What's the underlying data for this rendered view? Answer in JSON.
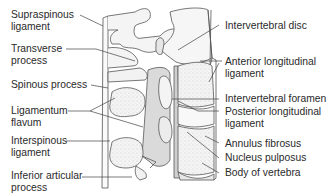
{
  "diagram": {
    "type": "anatomical-illustration",
    "colors": {
      "text": "#2a2a2a",
      "line": "#555555",
      "bone_fill": "#f4f4f4",
      "ligament_fill": "#d9d9d9",
      "stipple": "#aaaaaa"
    },
    "labels_left": [
      {
        "id": "supraspinous-ligament",
        "text": "Supraspinous\nligament"
      },
      {
        "id": "transverse-process",
        "text": "Transverse\nprocess"
      },
      {
        "id": "spinous-process",
        "text": "Spinous process"
      },
      {
        "id": "ligamentum-flavum",
        "text": "Ligamentum\nflavum"
      },
      {
        "id": "interspinous-ligament",
        "text": "Interspinous\nligament"
      },
      {
        "id": "inferior-articular-process",
        "text": "Inferior articular\nprocess"
      }
    ],
    "labels_right": [
      {
        "id": "intervertebral-disc",
        "text": "Intervertebral disc"
      },
      {
        "id": "anterior-longitudinal-ligament",
        "text": "Anterior longitudinal\nligament"
      },
      {
        "id": "intervertebral-foramen",
        "text": "Intervertebral foramen"
      },
      {
        "id": "posterior-longitudinal-ligament",
        "text": "Posterior longitudinal\nligament"
      },
      {
        "id": "annulus-fibrosus",
        "text": "Annulus fibrosus"
      },
      {
        "id": "nucleus-pulposus",
        "text": "Nucleus pulposus"
      },
      {
        "id": "body-of-vertebra",
        "text": "Body of vertebra"
      }
    ]
  }
}
